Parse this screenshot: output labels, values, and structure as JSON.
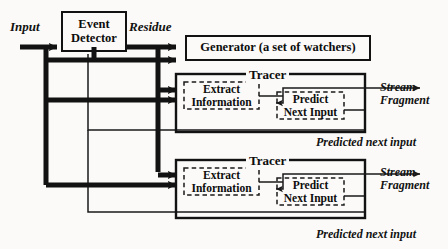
{
  "diagram": {
    "colors": {
      "ink": "#121212",
      "paper": "#fbfaf8",
      "thin": "#1a1a1a"
    },
    "labels": {
      "input": "Input",
      "residue": "Residue",
      "event_detector": "Event\nDetector",
      "generator": "Generator (a set of watchers)",
      "tracer": "Tracer",
      "extract_information": "Extract\nInformation",
      "predict_next_input": "Predict\nNext Input",
      "stream_fragment": "Stream\nFragment",
      "predicted_next_input": "Predicted next input"
    },
    "blocks": [
      {
        "id": "event-detector",
        "label": "Event\nDetector",
        "x": 62,
        "y": 12,
        "w": 64,
        "h": 39,
        "style": "solid"
      },
      {
        "id": "generator",
        "label": "Generator (a set of watchers)",
        "x": 186,
        "y": 36,
        "w": 184,
        "h": 24,
        "style": "solid"
      },
      {
        "id": "tracer-1",
        "label": "Tracer",
        "x": 176,
        "y": 74,
        "w": 189,
        "h": 58,
        "style": "solid"
      },
      {
        "id": "extract-1",
        "label": "Extract\nInformation",
        "x": 184,
        "y": 82,
        "w": 75,
        "h": 27,
        "style": "dashed"
      },
      {
        "id": "predict-1",
        "label": "Predict\nNext Input",
        "x": 277,
        "y": 92,
        "w": 67,
        "h": 27,
        "style": "dashed"
      },
      {
        "id": "tracer-2",
        "label": "Tracer",
        "x": 176,
        "y": 160,
        "w": 189,
        "h": 58,
        "style": "solid"
      },
      {
        "id": "extract-2",
        "label": "Extract\nInformation",
        "x": 184,
        "y": 168,
        "w": 75,
        "h": 27,
        "style": "dashed"
      },
      {
        "id": "predict-2",
        "label": "Predict\nNext Input",
        "x": 277,
        "y": 178,
        "w": 67,
        "h": 27,
        "style": "dashed"
      }
    ],
    "annotations": [
      {
        "id": "input-label",
        "text": "Input",
        "x": 10,
        "y": 22
      },
      {
        "id": "residue-label",
        "text": "Residue",
        "x": 131,
        "y": 22
      },
      {
        "id": "stream-fragment-1",
        "text": "Stream\nFragment",
        "x": 380,
        "y": 83
      },
      {
        "id": "predicted-next-input-1",
        "text": "Predicted next input",
        "x": 318,
        "y": 138
      },
      {
        "id": "stream-fragment-2",
        "text": "Stream\nFragment",
        "x": 380,
        "y": 168
      },
      {
        "id": "predicted-next-input-2",
        "text": "Predicted next input",
        "x": 318,
        "y": 230
      }
    ],
    "signals": [
      {
        "id": "input-bus",
        "from": "Input",
        "to": "Event Detector",
        "weight": "thick"
      },
      {
        "id": "input-fanout-tracer1",
        "from": "Input bus",
        "to": "Extract Information (Tracer 1)",
        "weight": "thick"
      },
      {
        "id": "input-fanout-tracer2",
        "from": "Input bus",
        "to": "Extract Information (Tracer 2)",
        "weight": "thick"
      },
      {
        "id": "residue-bus",
        "from": "Event Detector",
        "to": "Generator",
        "weight": "thick"
      },
      {
        "id": "residue-fanout-tracer1",
        "from": "Residue bus",
        "to": "Extract Information (Tracer 1)",
        "weight": "thick"
      },
      {
        "id": "residue-fanout-tracer2",
        "from": "Residue bus",
        "to": "Extract Information (Tracer 2)",
        "weight": "thick"
      },
      {
        "id": "stream-out-1",
        "from": "Tracer 1",
        "to": "Stream Fragment",
        "weight": "thin"
      },
      {
        "id": "stream-out-2",
        "from": "Tracer 2",
        "to": "Stream Fragment",
        "weight": "thin"
      },
      {
        "id": "feedback-1",
        "from": "Predict Next Input (Tracer 1)",
        "to": "Event Detector bus",
        "weight": "thin"
      },
      {
        "id": "feedback-2",
        "from": "Predict Next Input (Tracer 2)",
        "to": "Event Detector bus",
        "weight": "thin"
      }
    ]
  }
}
